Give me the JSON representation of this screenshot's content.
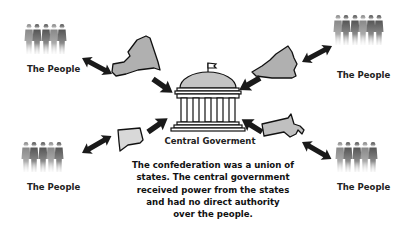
{
  "diagram": {
    "central": {
      "label": "Central Goverment",
      "icon": "capitol-building-icon"
    },
    "caption": [
      "The confederation was a union of",
      "states. The central government",
      "received power from the states",
      "and had no direct authority",
      "over the people."
    ],
    "groups": [
      {
        "position": "top-left",
        "people_label": "The People",
        "state_icon": "new-york-state-icon"
      },
      {
        "position": "top-right",
        "people_label": "The People",
        "state_icon": "virginia-state-icon"
      },
      {
        "position": "bottom-left",
        "people_label": "The People",
        "state_icon": "connecticut-state-icon"
      },
      {
        "position": "bottom-right",
        "people_label": "The People",
        "state_icon": "massachusetts-state-icon"
      }
    ],
    "arrows": {
      "people_to_state": "bidirectional",
      "state_to_central": "one-way toward central"
    },
    "colors": {
      "state_fill": "#b0b0b0",
      "outline": "#111111",
      "arrow": "#1a1a1a",
      "text": "#222222",
      "background": "#ffffff"
    }
  }
}
